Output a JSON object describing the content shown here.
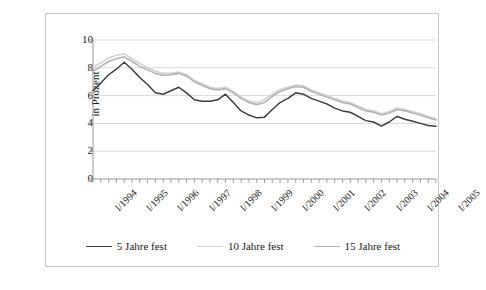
{
  "figure": {
    "top_cut_text": "",
    "background_color": "#ffffff",
    "border_color": "#c8c8c8"
  },
  "legend": {
    "position": "bottom-center",
    "items": [
      {
        "label": "5 Jahre fest",
        "color": "#3d3d3d"
      },
      {
        "label": "10 Jahre fest",
        "color": "#d2d2d2"
      },
      {
        "label": "15 Jahre fest",
        "color": "#b3b3b3"
      }
    ]
  },
  "chart_data": {
    "type": "line",
    "title": "",
    "xlabel": "",
    "ylabel": "in Prozent",
    "ylim": [
      0,
      10
    ],
    "yticks": [
      0,
      2,
      4,
      6,
      8,
      10
    ],
    "grid": true,
    "grid_axis": "y",
    "x_tick_labels": [
      "I/1994",
      "I/1995",
      "I/1996",
      "I/1997",
      "I/1998",
      "I/1999",
      "I/2000",
      "I/2001",
      "I/2002",
      "I/2003",
      "I/2004",
      "I/2005"
    ],
    "x_minor_ticks_per_label": 4,
    "x": [
      "I/1994",
      "II/1994",
      "III/1994",
      "IV/1994",
      "I/1995",
      "II/1995",
      "III/1995",
      "IV/1995",
      "I/1996",
      "II/1996",
      "III/1996",
      "IV/1996",
      "I/1997",
      "II/1997",
      "III/1997",
      "IV/1997",
      "I/1998",
      "II/1998",
      "III/1998",
      "IV/1998",
      "I/1999",
      "II/1999",
      "III/1999",
      "IV/1999",
      "I/2000",
      "II/2000",
      "III/2000",
      "IV/2000",
      "I/2001",
      "II/2001",
      "III/2001",
      "IV/2001",
      "I/2002",
      "II/2002",
      "III/2002",
      "IV/2002",
      "I/2003",
      "II/2003",
      "III/2003",
      "IV/2003",
      "I/2004",
      "II/2004",
      "III/2004",
      "IV/2004",
      "I/2005"
    ],
    "series": [
      {
        "name": "5 Jahre fest",
        "color": "#3d3d3d",
        "width": 1.5,
        "values": [
          6.35,
          6.9,
          7.5,
          7.9,
          8.4,
          7.9,
          7.3,
          6.8,
          6.2,
          6.1,
          6.35,
          6.6,
          6.2,
          5.7,
          5.6,
          5.6,
          5.7,
          6.1,
          5.5,
          4.9,
          4.6,
          4.4,
          4.45,
          5.0,
          5.5,
          5.8,
          6.2,
          6.1,
          5.8,
          5.6,
          5.4,
          5.1,
          4.9,
          4.8,
          4.5,
          4.2,
          4.1,
          3.8,
          4.1,
          4.5,
          4.3,
          4.15,
          4.0,
          3.85,
          3.8
        ]
      },
      {
        "name": "10 Jahre fest",
        "color": "#d2d2d2",
        "width": 1.6,
        "values": [
          8.05,
          8.35,
          8.7,
          8.9,
          9.0,
          8.65,
          8.3,
          8.0,
          7.75,
          7.6,
          7.6,
          7.7,
          7.5,
          7.1,
          6.85,
          6.6,
          6.5,
          6.6,
          6.3,
          5.9,
          5.6,
          5.5,
          5.7,
          6.1,
          6.45,
          6.6,
          6.75,
          6.7,
          6.4,
          6.2,
          6.0,
          5.8,
          5.6,
          5.5,
          5.25,
          5.0,
          4.9,
          4.7,
          4.85,
          5.1,
          5.0,
          4.85,
          4.7,
          4.5,
          4.35
        ]
      },
      {
        "name": "15 Jahre fest",
        "color": "#b3b3b3",
        "width": 1.6,
        "values": [
          7.75,
          8.1,
          8.45,
          8.65,
          8.8,
          8.45,
          8.1,
          7.85,
          7.6,
          7.45,
          7.5,
          7.6,
          7.4,
          7.0,
          6.75,
          6.5,
          6.4,
          6.5,
          6.2,
          5.8,
          5.5,
          5.35,
          5.5,
          5.95,
          6.3,
          6.5,
          6.65,
          6.6,
          6.3,
          6.1,
          5.9,
          5.7,
          5.5,
          5.4,
          5.15,
          4.9,
          4.8,
          4.6,
          4.75,
          5.0,
          4.9,
          4.75,
          4.6,
          4.4,
          4.25
        ]
      }
    ]
  }
}
